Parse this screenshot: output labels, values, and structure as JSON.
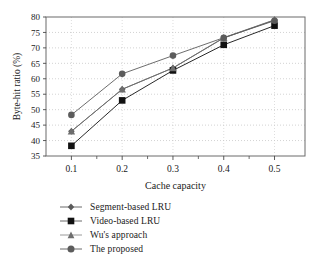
{
  "chart_data": {
    "type": "line",
    "title": "",
    "xlabel": "Cache capacity",
    "ylabel": "Byte-hit ratio (%)",
    "x": [
      0.1,
      0.2,
      0.3,
      0.4,
      0.5
    ],
    "xtick_labels": [
      "0.1",
      "0.2",
      "0.3",
      "0.4",
      "0.5"
    ],
    "ytick_labels": [
      "35",
      "40",
      "45",
      "50",
      "55",
      "60",
      "65",
      "70",
      "75",
      "80"
    ],
    "yticks": [
      35,
      40,
      45,
      50,
      55,
      60,
      65,
      70,
      75,
      80
    ],
    "xlim": [
      0.05,
      0.56
    ],
    "ylim": [
      35,
      80
    ],
    "grid": true,
    "grid_style": "dotted",
    "legend_position": "below-left",
    "series": [
      {
        "name": "Segment-based LRU",
        "marker": "diamond",
        "color": "#5a5a5a",
        "values": [
          43.0,
          56.6,
          63.5,
          73.2,
          79.0
        ]
      },
      {
        "name": "Video-based LRU",
        "marker": "square",
        "color": "#111111",
        "values": [
          38.3,
          53.0,
          62.7,
          71.0,
          77.2
        ]
      },
      {
        "name": "Wu's approach",
        "marker": "triangle",
        "color": "#6e6e6e",
        "values": [
          43.0,
          56.6,
          63.5,
          73.3,
          79.1
        ]
      },
      {
        "name": "The proposed",
        "marker": "circle",
        "color": "#5c5c5c",
        "values": [
          48.3,
          61.6,
          67.5,
          73.3,
          78.8
        ]
      }
    ]
  },
  "legend": {
    "items": [
      {
        "label": "Segment-based LRU",
        "marker": "diamond",
        "color": "#5a5a5a"
      },
      {
        "label": "Video-based LRU",
        "marker": "square",
        "color": "#111111"
      },
      {
        "label": "Wu's approach",
        "marker": "triangle",
        "color": "#6e6e6e"
      },
      {
        "label": "The proposed",
        "marker": "circle",
        "color": "#5c5c5c"
      }
    ]
  },
  "axes": {
    "y_title": "Byte-hit ratio (%)",
    "x_title": "Cache capacity"
  }
}
